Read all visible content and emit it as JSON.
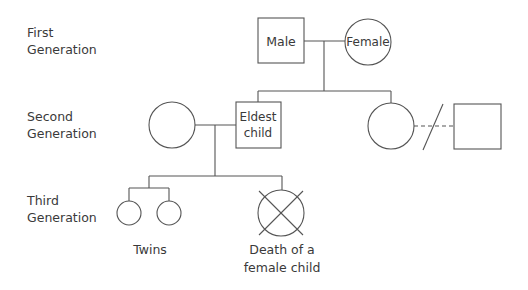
{
  "generations": [
    {
      "line1": "First",
      "line2": "Generation"
    },
    {
      "line1": "Second",
      "line2": "Generation"
    },
    {
      "line1": "Third",
      "line2": "Generation"
    }
  ],
  "nodes": {
    "male": "Male",
    "female": "Female",
    "eldest_line1": "Eldest",
    "eldest_line2": "child"
  },
  "captions": {
    "twins": "Twins",
    "death_line1": "Death of a",
    "death_line2": "female child"
  },
  "colors": {
    "stroke": "#555555",
    "text": "#3a3a3a",
    "background": "#ffffff"
  }
}
